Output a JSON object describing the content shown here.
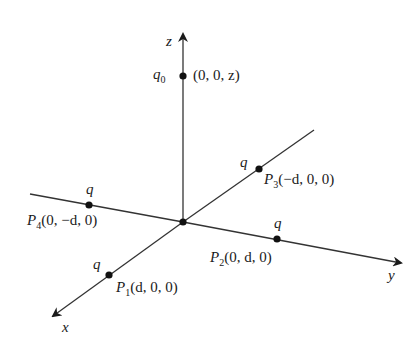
{
  "diagram": {
    "type": "3d-coordinate-axes-with-charges",
    "colors": {
      "line": "#333333",
      "text": "#1a1a1a",
      "background": "#ffffff"
    },
    "axes": {
      "z": {
        "label": "z"
      },
      "y": {
        "label": "y"
      },
      "x": {
        "label": "x"
      }
    },
    "charges": [
      {
        "id": "q0",
        "charge_label": "q",
        "charge_sub": "0",
        "point_name": "",
        "point_sub": "",
        "coords": "(0, 0, z)"
      },
      {
        "id": "P1",
        "charge_label": "q",
        "charge_sub": "",
        "point_name": "P",
        "point_sub": "1",
        "coords": "(d, 0, 0)"
      },
      {
        "id": "P2",
        "charge_label": "q",
        "charge_sub": "",
        "point_name": "P",
        "point_sub": "2",
        "coords": "(0, d, 0)"
      },
      {
        "id": "P3",
        "charge_label": "q",
        "charge_sub": "",
        "point_name": "P",
        "point_sub": "3",
        "coords": "(−d, 0, 0)"
      },
      {
        "id": "P4",
        "charge_label": "q",
        "charge_sub": "",
        "point_name": "P",
        "point_sub": "4",
        "coords": "(0, −d, 0)"
      }
    ]
  }
}
